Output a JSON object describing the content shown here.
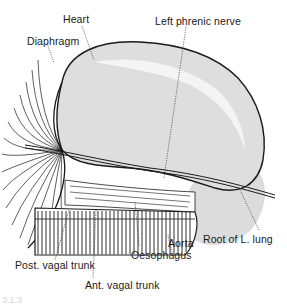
{
  "figure": {
    "type": "anatomical line drawing",
    "colors": {
      "background": "#ffffff",
      "outline": "#1a1a1a",
      "tissue_fill": "#d9d9d9",
      "highlight": "#f2f2f2"
    }
  },
  "labels": [
    {
      "id": "heart",
      "text": "Heart"
    },
    {
      "id": "left-phrenic-nerve",
      "text": "Left phrenic nerve"
    },
    {
      "id": "diaphragm",
      "text": "Diaphragm"
    },
    {
      "id": "aorta",
      "text": "Aorta"
    },
    {
      "id": "root-of-l-lung",
      "text": "Root of L. lung"
    },
    {
      "id": "oesophagus",
      "text": "Oesophagus"
    },
    {
      "id": "post-vagal-trunk",
      "text": "Post. vagal trunk"
    },
    {
      "id": "ant-vagal-trunk",
      "text": "Ant. vagal trunk"
    }
  ],
  "caption": {
    "text": "3.1.3"
  }
}
